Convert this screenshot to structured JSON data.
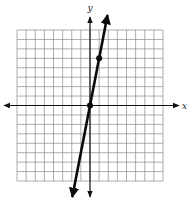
{
  "chart_data": {
    "type": "line",
    "title": "",
    "xlabel": "x",
    "ylabel": "y",
    "xlim": [
      -8,
      8
    ],
    "ylim": [
      -8,
      8
    ],
    "grid": true,
    "grid_step": 1,
    "tick_labels": false,
    "legend": null,
    "series": [
      {
        "name": "line",
        "equation": "y = 5x",
        "slope": 5,
        "intercept": 0,
        "marked_points": [
          [
            0,
            0
          ],
          [
            1,
            5
          ]
        ],
        "arrows_both_ends": true
      }
    ]
  },
  "style": {
    "grid_color": "#8a8a8a",
    "axis_color": "#111111",
    "line_color": "#0a0a0a",
    "background": "#ffffff"
  },
  "labels": {
    "x_axis": "x",
    "y_axis": "y"
  }
}
